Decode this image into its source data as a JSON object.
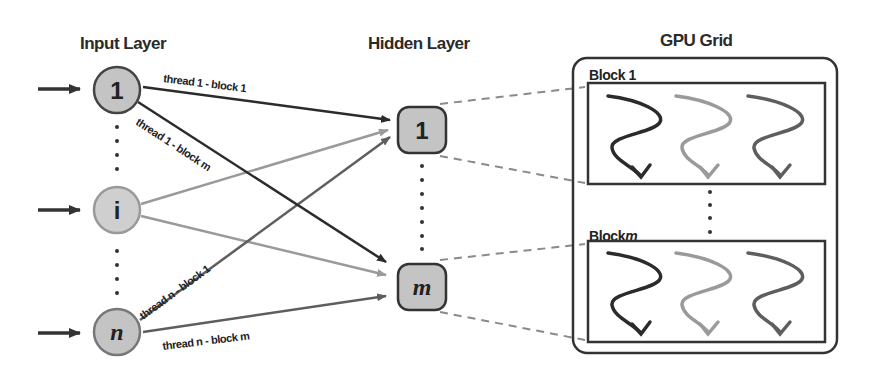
{
  "titles": {
    "input_layer": "Input Layer",
    "hidden_layer": "Hidden Layer",
    "gpu_grid": "GPU Grid"
  },
  "input_nodes": [
    {
      "label": "1"
    },
    {
      "label": "i"
    },
    {
      "label": "n"
    }
  ],
  "hidden_nodes": [
    {
      "label": "1"
    },
    {
      "label": "m"
    }
  ],
  "edge_labels": {
    "t1_b1": "thread 1 - block 1",
    "t1_bm": "thread 1 - block m",
    "tn_b1": "thread n - block 1",
    "tn_bm": "thread n - block m"
  },
  "blocks": [
    {
      "label": "Block 1",
      "prefix": "Block ",
      "suffix": "1"
    },
    {
      "label": "Block m",
      "prefix": "Block",
      "suffix": "m"
    }
  ],
  "colors": {
    "node_fill": "#c4c4c4",
    "dark_edge": "#2b2b2b",
    "light_edge": "#9a9a9a",
    "mid_edge": "#5e5e5e",
    "dashed": "#8a8a8a"
  }
}
